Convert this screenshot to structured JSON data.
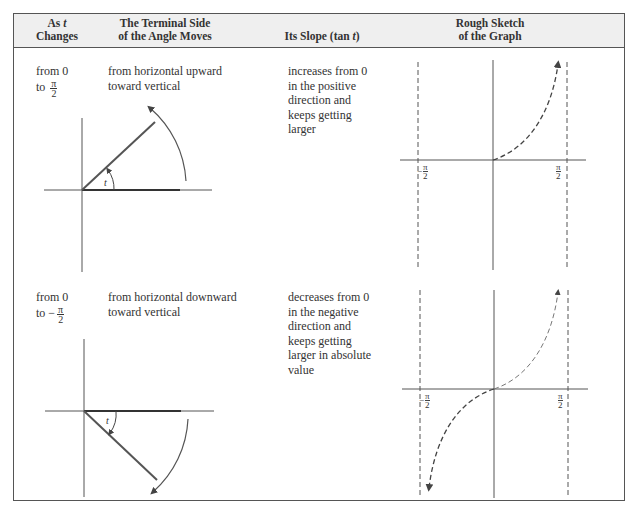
{
  "table": {
    "headers": [
      {
        "line1": "As t",
        "line1_prefix": "As ",
        "line1_var": "t",
        "line2": "Changes"
      },
      {
        "line1": "The Terminal Side",
        "line2": "of the Angle Moves"
      },
      {
        "line1": "Its Slope (tan t)",
        "line1_prefix": "Its Slope (tan ",
        "line1_var": "t",
        "line1_suffix": ")"
      },
      {
        "line1": "Rough Sketch",
        "line2": "of the Graph"
      }
    ],
    "rows": [
      {
        "as_t_changes": {
          "line1": "from 0",
          "line2_prefix": "to ",
          "frac_num": "π",
          "frac_den": "2"
        },
        "terminal_side": {
          "line1": "from horizontal upward",
          "line2": "toward vertical"
        },
        "slope": [
          "increases from 0",
          "in the positive",
          "direction and",
          "keeps getting",
          "larger"
        ],
        "angle_label": "t",
        "graph": {
          "left_label_sign": "−",
          "left_num": "π",
          "left_den": "2",
          "right_num": "π",
          "right_den": "2"
        }
      },
      {
        "as_t_changes": {
          "line1": "from 0",
          "line2_prefix": "to −",
          "frac_num": "π",
          "frac_den": "2"
        },
        "terminal_side": {
          "line1": "from horizontal downward",
          "line2": "toward vertical"
        },
        "slope": [
          "decreases from 0",
          "in the negative",
          "direction and",
          "keeps getting",
          "larger in absolute",
          "value"
        ],
        "angle_label": "t",
        "graph": {
          "left_label_sign": "−",
          "left_num": "π",
          "left_den": "2",
          "right_num": "π",
          "right_den": "2"
        }
      }
    ]
  },
  "colors": {
    "header_bg": "#efefef",
    "border": "#555555",
    "text": "#333333",
    "line": "#555555"
  }
}
